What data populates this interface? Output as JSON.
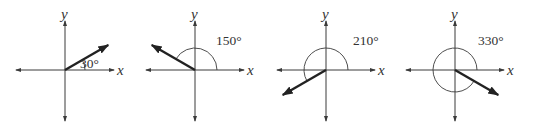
{
  "figure": {
    "panels": [
      {
        "angle_deg": 30,
        "label": "30°",
        "x_axis_label": "x",
        "y_axis_label": "y"
      },
      {
        "angle_deg": 150,
        "label": "150°",
        "x_axis_label": "x",
        "y_axis_label": "y"
      },
      {
        "angle_deg": 210,
        "label": "210°",
        "x_axis_label": "x",
        "y_axis_label": "y"
      },
      {
        "angle_deg": 330,
        "label": "330°",
        "x_axis_label": "x",
        "y_axis_label": "y"
      }
    ]
  },
  "colors": {
    "ink": "#222222",
    "axis": "#3a3a3a"
  }
}
